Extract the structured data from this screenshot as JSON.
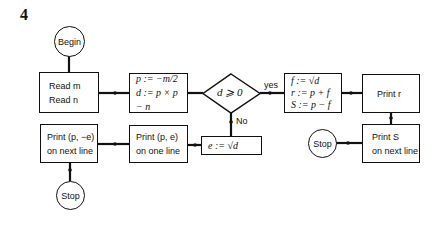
{
  "figure_number": "4",
  "nodes": {
    "begin": {
      "label": "Begin"
    },
    "read": {
      "lines": [
        "Read m",
        "Read n"
      ]
    },
    "compute_pd": {
      "lines": [
        "p := −m/2",
        "d := p × p − n"
      ]
    },
    "decision": {
      "label": "d ⩾ 0",
      "yes_label": "yes",
      "no_label": "No"
    },
    "compute_frs": {
      "lines": [
        "f := √d",
        "r := p + f",
        "S := p − f"
      ]
    },
    "print_r": {
      "label": "Print r"
    },
    "print_s": {
      "lines": [
        "Print S",
        "on next line"
      ]
    },
    "stop_right": {
      "label": "Stop"
    },
    "compute_e": {
      "label": "e := √d"
    },
    "print_pe": {
      "lines": [
        "Print (p, e)",
        "on one line"
      ]
    },
    "print_p_neg_e": {
      "lines": [
        "Print (p, −e)",
        "on next line"
      ]
    },
    "stop_left": {
      "label": "Stop"
    }
  }
}
